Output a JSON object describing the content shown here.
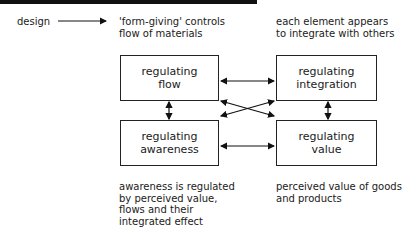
{
  "header": {
    "design_label": "design",
    "form_giving_note": "'form-giving' controls\nflow of materials",
    "integrate_note": "each element appears\nto integrate with others"
  },
  "boxes": {
    "flow": "regulating\nflow",
    "integration": "regulating\nintegration",
    "awareness": "regulating\nawareness",
    "value": "regulating\nvalue"
  },
  "footer": {
    "awareness_note": "awareness is regulated\nby perceived value,\nflows and their\nintegrated effect",
    "value_note": "perceived value of goods\nand products"
  }
}
